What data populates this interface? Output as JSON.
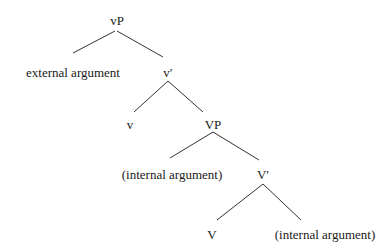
{
  "diagram": {
    "type": "syntax-tree",
    "nodes": [
      {
        "id": "vP",
        "label": "vP",
        "x": 117,
        "y": 20
      },
      {
        "id": "ext_arg",
        "label": "external argument",
        "x": 73,
        "y": 72
      },
      {
        "id": "v_bar",
        "label": "v′",
        "x": 168,
        "y": 72
      },
      {
        "id": "v",
        "label": "v",
        "x": 130,
        "y": 124
      },
      {
        "id": "VP",
        "label": "VP",
        "x": 213,
        "y": 124
      },
      {
        "id": "int_arg_1",
        "label": "(internal argument)",
        "x": 172,
        "y": 174
      },
      {
        "id": "V_bar",
        "label": "V′",
        "x": 263,
        "y": 174
      },
      {
        "id": "V",
        "label": "V",
        "x": 212,
        "y": 234
      },
      {
        "id": "int_arg_2",
        "label": "(internal argument)",
        "x": 325,
        "y": 234
      }
    ],
    "edges": [
      {
        "from": "vP",
        "to": "ext_arg",
        "x1": 115,
        "y1": 31,
        "x2": 73,
        "y2": 53
      },
      {
        "from": "vP",
        "to": "v_bar",
        "x1": 117,
        "y1": 31,
        "x2": 163,
        "y2": 57
      },
      {
        "from": "v_bar",
        "to": "v",
        "x1": 168,
        "y1": 81,
        "x2": 134,
        "y2": 112
      },
      {
        "from": "v_bar",
        "to": "VP",
        "x1": 168,
        "y1": 81,
        "x2": 203,
        "y2": 112
      },
      {
        "from": "VP",
        "to": "int_arg_1",
        "x1": 213,
        "y1": 132,
        "x2": 170,
        "y2": 158
      },
      {
        "from": "VP",
        "to": "V_bar",
        "x1": 213,
        "y1": 132,
        "x2": 259,
        "y2": 160
      },
      {
        "from": "V_bar",
        "to": "V",
        "x1": 263,
        "y1": 184,
        "x2": 217,
        "y2": 220
      },
      {
        "from": "V_bar",
        "to": "int_arg_2",
        "x1": 263,
        "y1": 184,
        "x2": 301,
        "y2": 220
      }
    ]
  }
}
